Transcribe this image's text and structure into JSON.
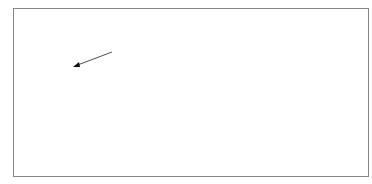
{
  "figure": {
    "side_mark": "s",
    "address_label": "213",
    "steps": [
      {
        "map": "w",
        "subscript": "3"
      },
      {
        "map": "w",
        "subscript": "1"
      },
      {
        "map": "w",
        "subscript": "2"
      }
    ],
    "stages": [
      {
        "name": "stage-0",
        "level": 0,
        "filled_address": ""
      },
      {
        "name": "stage-1",
        "level": 1,
        "filled_address": "3"
      },
      {
        "name": "stage-2",
        "level": 2,
        "filled_address": "31"
      },
      {
        "name": "stage-3",
        "level": 3,
        "filled_address": "312"
      }
    ],
    "top_sierpinski": {
      "level": 3,
      "filled_address": "213"
    }
  }
}
